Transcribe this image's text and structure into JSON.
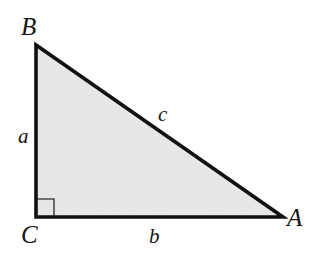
{
  "figure": {
    "kind": "right-triangle-diagram",
    "width": 316,
    "height": 269,
    "background_color": "#ffffff",
    "fill_color": "#e9e9e9",
    "stroke_color": "#111111",
    "stroke_width": 3.6,
    "right_angle_marker": {
      "present": true,
      "at_vertex": "C",
      "size": 18,
      "stroke_color": "#4a4a4a",
      "stroke_width": 1.6
    },
    "vertices": [
      {
        "name": "B",
        "label": "B",
        "x": 36,
        "y": 45
      },
      {
        "name": "C",
        "label": "C",
        "x": 36,
        "y": 217
      },
      {
        "name": "A",
        "label": "A",
        "x": 283,
        "y": 217
      }
    ],
    "sides": [
      {
        "name": "a",
        "label": "a",
        "from": "B",
        "to": "C",
        "role": "leg"
      },
      {
        "name": "b",
        "label": "b",
        "from": "C",
        "to": "A",
        "role": "leg"
      },
      {
        "name": "c",
        "label": "c",
        "from": "B",
        "to": "A",
        "role": "hypotenuse"
      }
    ]
  },
  "labels": {
    "vertex_B": "B",
    "vertex_C": "C",
    "vertex_A": "A",
    "side_a": "a",
    "side_b": "b",
    "side_c": "c"
  }
}
